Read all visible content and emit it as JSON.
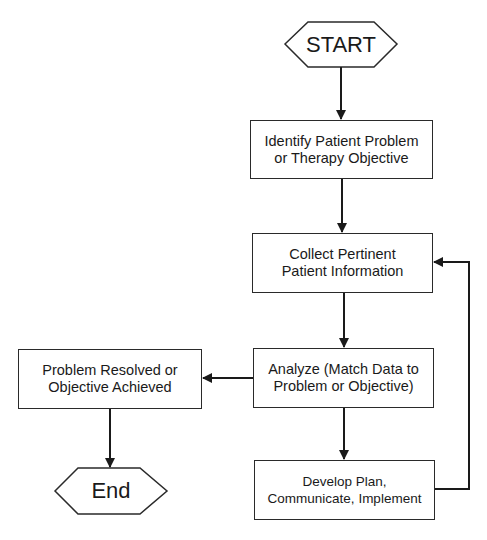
{
  "diagram": {
    "type": "flowchart",
    "nodes": {
      "start": {
        "label": "START",
        "shape": "hexagon"
      },
      "identify": {
        "line1": "Identify Patient Problem",
        "line2": "or Therapy Objective",
        "shape": "rectangle"
      },
      "collect": {
        "line1": "Collect Pertinent",
        "line2": "Patient Information",
        "shape": "rectangle"
      },
      "analyze": {
        "line1": "Analyze (Match Data to",
        "line2": "Problem or Objective)",
        "shape": "rectangle"
      },
      "resolved": {
        "line1": "Problem Resolved or",
        "line2": "Objective Achieved",
        "shape": "rectangle"
      },
      "develop": {
        "line1": "Develop Plan,",
        "line2": "Communicate, Implement",
        "shape": "rectangle"
      },
      "end": {
        "label": "End",
        "shape": "hexagon"
      }
    },
    "edges": [
      {
        "from": "start",
        "to": "identify"
      },
      {
        "from": "identify",
        "to": "collect"
      },
      {
        "from": "collect",
        "to": "analyze"
      },
      {
        "from": "analyze",
        "to": "resolved"
      },
      {
        "from": "analyze",
        "to": "develop"
      },
      {
        "from": "develop",
        "to": "collect"
      },
      {
        "from": "resolved",
        "to": "end"
      }
    ],
    "colors": {
      "stroke": "#2a2a2a",
      "fill": "#ffffff",
      "text": "#1a1a1a"
    }
  }
}
